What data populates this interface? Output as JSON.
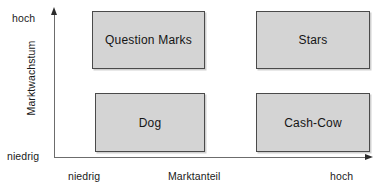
{
  "diagram": {
    "type": "bcg-matrix",
    "background_color": "#ffffff",
    "box_fill_color": "#d4d4d4",
    "box_border_color": "#4a4a4a",
    "axis_color": "#6c6c6c"
  },
  "y_axis": {
    "title": "Marktwachstum",
    "high_label": "hoch",
    "low_label": "niedrig"
  },
  "x_axis": {
    "title": "Marktanteil",
    "low_label": "niedrig",
    "high_label": "hoch"
  },
  "quadrants": [
    {
      "id": "question-marks",
      "label": "Question Marks",
      "market_share": "niedrig",
      "market_growth": "hoch"
    },
    {
      "id": "stars",
      "label": "Stars",
      "market_share": "hoch",
      "market_growth": "hoch"
    },
    {
      "id": "dog",
      "label": "Dog",
      "market_share": "niedrig",
      "market_growth": "niedrig"
    },
    {
      "id": "cash-cow",
      "label": "Cash-Cow",
      "market_share": "hoch",
      "market_growth": "niedrig"
    }
  ]
}
